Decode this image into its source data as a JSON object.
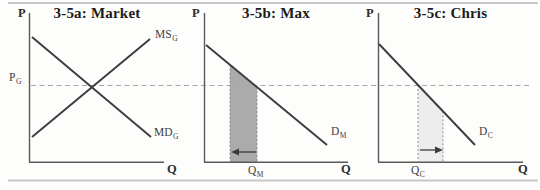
{
  "figure": {
    "panels": [
      {
        "title": "3-5a: Market",
        "y_axis_label": "P",
        "x_axis_label": "Q",
        "price_line_label": {
          "main": "P",
          "sub": "G"
        },
        "supply_curve_label": {
          "main": "MS",
          "sub": "G"
        },
        "demand_curve_label": {
          "main": "MD",
          "sub": "G"
        }
      },
      {
        "title": "3-5b: Max",
        "y_axis_label": "P",
        "x_axis_label": "Q",
        "demand_curve_label": {
          "main": "D",
          "sub": "M"
        },
        "quantity_label": {
          "main": "Q",
          "sub": "M"
        },
        "shaded_band": "dark",
        "arrow_direction": "left"
      },
      {
        "title": "3-5c: Chris",
        "y_axis_label": "P",
        "x_axis_label": "Q",
        "demand_curve_label": {
          "main": "D",
          "sub": "C"
        },
        "quantity_label": {
          "main": "Q",
          "sub": "C"
        },
        "shaded_band": "light",
        "arrow_direction": "right"
      }
    ],
    "colors": {
      "curve": "#3c3c3c",
      "axis": "#5a5a5a",
      "dashed_price_line": "#a8a8a8",
      "band_fill_dark": "#ababab",
      "band_fill_light": "#ededed",
      "band_edge": "#8f8f8f",
      "page_rule": "#c8c8c8"
    }
  }
}
